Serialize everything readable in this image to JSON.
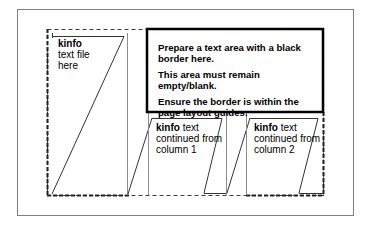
{
  "page": {
    "border_color": "#7f7f7f",
    "guide_color": "#3a3a3a",
    "frame_color": "#8c8c8c"
  },
  "instructions_box": {
    "border_color": "#000000",
    "lines": [
      "Prepare a text area with a black border here.",
      "This area must remain empty/blank.",
      "Ensure the border is within the page layout guides."
    ]
  },
  "columns": [
    {
      "keyword": "kinfo",
      "rest_line1": "",
      "line2": "text file",
      "line3": "here"
    },
    {
      "keyword": "kinfo",
      "rest_line1": " text",
      "line2": "continued from",
      "line3": "column 1"
    },
    {
      "keyword": "kinfo",
      "rest_line1": " text",
      "line2": "continued from",
      "line3": "column 2"
    }
  ]
}
